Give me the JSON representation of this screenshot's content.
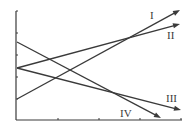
{
  "chart_data": {
    "type": "line",
    "title": "",
    "xlabel": "",
    "ylabel": "",
    "grid": false,
    "legend": "none (inline Roman-numeral labels at line ends)",
    "axes": {
      "x_ticks_count": 4,
      "y_ticks_count": 4,
      "tick_labels": false
    },
    "series": [
      {
        "name": "I",
        "start": [
          0,
          2.0
        ],
        "end": [
          4,
          10.0
        ],
        "direction": "increasing",
        "arrow": true,
        "label": "I"
      },
      {
        "name": "II",
        "start": [
          0,
          5.0
        ],
        "end": [
          4,
          9.0
        ],
        "direction": "increasing",
        "arrow": true,
        "label": "II"
      },
      {
        "name": "III",
        "start": [
          0,
          5.0
        ],
        "end": [
          4,
          1.0
        ],
        "direction": "decreasing",
        "arrow": true,
        "label": "III"
      },
      {
        "name": "IV",
        "start": [
          0,
          7.0
        ],
        "end": [
          3.5,
          0.2
        ],
        "direction": "decreasing",
        "arrow": true,
        "label": "IV"
      }
    ]
  },
  "labels": {
    "I": "I",
    "II": "II",
    "III": "III",
    "IV": "IV"
  },
  "geometry": {
    "origin": [
      16,
      120
    ],
    "y_axis_top": 11,
    "x_axis_right": 182,
    "y_ticks": [
      33,
      55,
      77,
      99
    ],
    "x_ticks": [
      58,
      99,
      140,
      181
    ],
    "lines": {
      "I": {
        "x1": 17,
        "y1": 99,
        "x2": 180,
        "y2": 10
      },
      "II": {
        "x1": 17,
        "y1": 68,
        "x2": 180,
        "y2": 24
      },
      "III": {
        "x1": 17,
        "y1": 68,
        "x2": 181,
        "y2": 110
      },
      "IV": {
        "x1": 17,
        "y1": 42,
        "x2": 161,
        "y2": 118
      }
    },
    "label_positions": {
      "I": [
        150,
        19
      ],
      "II": [
        167,
        39
      ],
      "III": [
        166,
        102
      ],
      "IV": [
        120,
        117
      ]
    }
  },
  "colors": {
    "line": "#3a3a3a",
    "background": "#ffffff"
  }
}
